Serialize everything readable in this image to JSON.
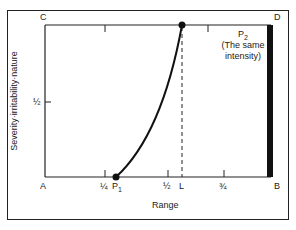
{
  "diagram": {
    "corners": {
      "top_left": "C",
      "top_right": "D",
      "bottom_left": "A",
      "bottom_right": "B"
    },
    "x_axis": {
      "label": "Range",
      "ticks": [
        "¼",
        "½",
        "¾"
      ],
      "markers": {
        "p1": "P",
        "p1_sub": "1",
        "l": "L"
      }
    },
    "y_axis": {
      "label": "Severity·irritability·nature",
      "ticks": [
        "½"
      ]
    },
    "annotation": {
      "title": "P",
      "title_sub": "2",
      "line1": "(The same",
      "line2": "intensity)"
    },
    "colors": {
      "line": "#111111",
      "frame": "#222222",
      "background": "#ffffff"
    }
  }
}
